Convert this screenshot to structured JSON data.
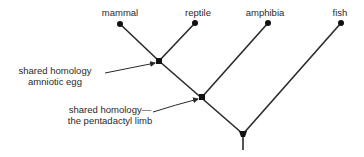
{
  "diagram": {
    "type": "cladogram",
    "taxa": [
      {
        "name": "mammal",
        "x": 120,
        "y": 24
      },
      {
        "name": "reptile",
        "x": 195,
        "y": 23
      },
      {
        "name": "amphibia",
        "x": 268,
        "y": 23
      },
      {
        "name": "fish",
        "x": 341,
        "y": 23
      }
    ],
    "nodes": [
      {
        "id": "amniote",
        "x": 159,
        "y": 61
      },
      {
        "id": "tetrapod",
        "x": 202,
        "y": 97
      },
      {
        "id": "root",
        "x": 243,
        "y": 134
      }
    ],
    "annotations": [
      {
        "line1": "shared homology",
        "line2": "amniotic egg",
        "target": "amniote"
      },
      {
        "line1": "shared homology—",
        "line2": "the pentadactyl limb",
        "target": "tetrapod"
      }
    ],
    "colors": {
      "line": "#2a2a2a",
      "text": "#2a2a2a"
    }
  }
}
